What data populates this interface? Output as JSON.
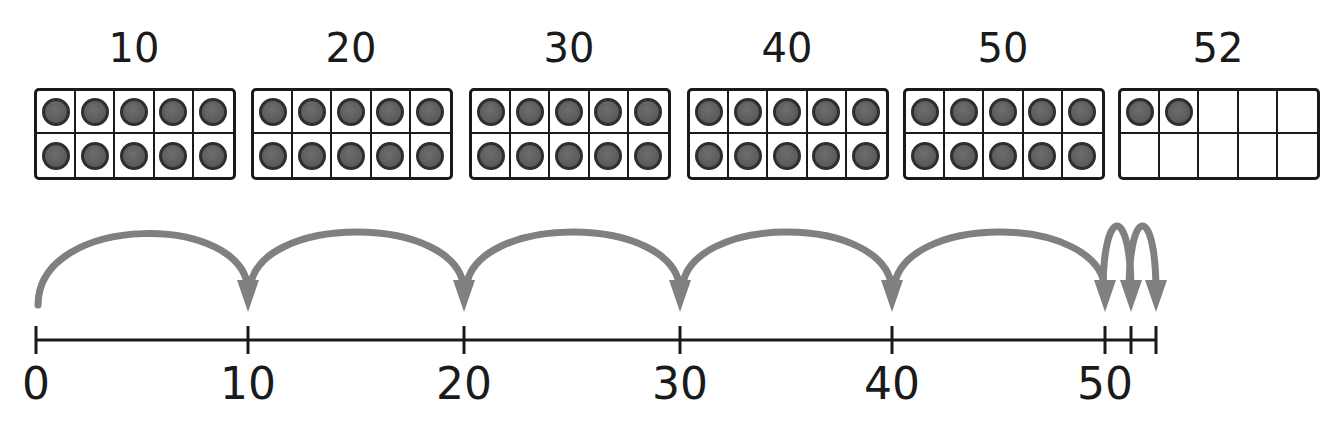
{
  "frames": [
    {
      "label": "10",
      "filled": 10,
      "x": 34
    },
    {
      "label": "20",
      "filled": 10,
      "x": 251
    },
    {
      "label": "30",
      "filled": 10,
      "x": 469
    },
    {
      "label": "40",
      "filled": 10,
      "x": 687
    },
    {
      "label": "50",
      "filled": 10,
      "x": 903
    },
    {
      "label": "52",
      "filled": 2,
      "x": 1118
    }
  ],
  "number_line": {
    "start": 0,
    "end": 52,
    "ticks": [
      {
        "value": 0,
        "label": "0",
        "x": 36
      },
      {
        "value": 10,
        "label": "10",
        "x": 248
      },
      {
        "value": 20,
        "label": "20",
        "x": 464
      },
      {
        "value": 30,
        "label": "30",
        "x": 680
      },
      {
        "value": 40,
        "label": "40",
        "x": 892
      },
      {
        "value": 50,
        "label": "50",
        "x": 1105
      },
      {
        "value": 51,
        "label": "",
        "x": 1131
      },
      {
        "value": 52,
        "label": "",
        "x": 1156
      }
    ],
    "jumps": [
      {
        "from": 0,
        "to": 10,
        "size": 10
      },
      {
        "from": 10,
        "to": 20,
        "size": 10
      },
      {
        "from": 20,
        "to": 30,
        "size": 10
      },
      {
        "from": 30,
        "to": 40,
        "size": 10
      },
      {
        "from": 40,
        "to": 50,
        "size": 10
      },
      {
        "from": 50,
        "to": 51,
        "size": 1
      },
      {
        "from": 51,
        "to": 52,
        "size": 1
      }
    ]
  },
  "colors": {
    "ink": "#1a1a1a",
    "arrow": "#808080",
    "counter": "#5c5c5c",
    "counter_rim": "#2e2e2e",
    "background": "#ffffff"
  }
}
